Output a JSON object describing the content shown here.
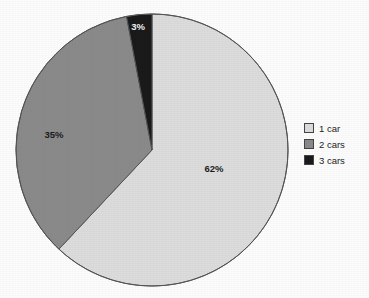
{
  "chart_data": {
    "type": "pie",
    "title": "",
    "subtitle": "",
    "xlabel": "",
    "ylabel": "",
    "grid": false,
    "legend_position": "right",
    "categories": [
      "1 car",
      "2 cars",
      "3 cars"
    ],
    "values": [
      62,
      35,
      3
    ],
    "value_labels": [
      "62%",
      "35%",
      "3%"
    ],
    "colors": [
      "#dcdcdc",
      "#8a8a8a",
      "#1a1a1a"
    ],
    "label_text_colors": [
      "#1c1c1c",
      "#1c1c1c",
      "#f2f2f2"
    ],
    "slices": [
      {
        "name": "1 car",
        "value": 62,
        "label": "62%",
        "color": "#dcdcdc",
        "start_angle_deg": 0,
        "end_angle_deg": 223.2,
        "label_x": 214,
        "label_y": 172
      },
      {
        "name": "2 cars",
        "value": 35,
        "label": "35%",
        "color": "#8a8a8a",
        "start_angle_deg": 223.2,
        "end_angle_deg": 349.2,
        "label_x": 54,
        "label_y": 138
      },
      {
        "name": "3 cars",
        "value": 3,
        "label": "3%",
        "color": "#1a1a1a",
        "start_angle_deg": 349.2,
        "end_angle_deg": 360,
        "label_x": 138,
        "label_y": 30
      }
    ],
    "geometry": {
      "center_x": 152,
      "center_y": 150,
      "radius": 136,
      "outline_color": "#555555"
    }
  },
  "legend": {
    "items": [
      {
        "label": "1 car",
        "color": "#dcdcdc"
      },
      {
        "label": "2 cars",
        "color": "#8a8a8a"
      },
      {
        "label": "3 cars",
        "color": "#1a1a1a"
      }
    ]
  }
}
